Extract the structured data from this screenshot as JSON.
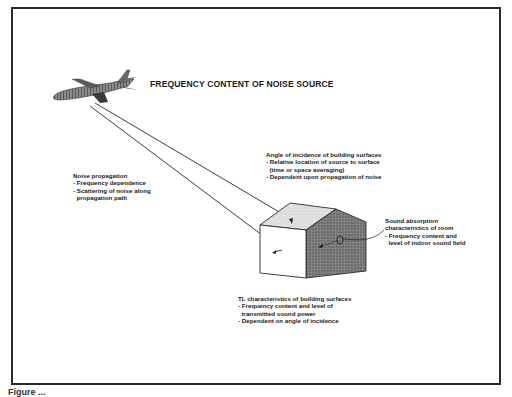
{
  "diagram": {
    "title": "FREQUENCY CONTENT OF NOISE SOURCE",
    "noise_propagation": {
      "heading": "Noise propagation",
      "bullets": [
        "- Frequency dependence",
        "- Scattering of noise along",
        "  propagation path"
      ]
    },
    "angle_of_incidence": {
      "heading": "Angle of incidence of building surfaces",
      "bullets": [
        "- Relative location of source to surface",
        "  (time or space averaging)",
        "- Dependent upon propagation of noise"
      ]
    },
    "sound_absorption": {
      "heading": "Sound absorption",
      "heading2": "characteristics of room",
      "bullets": [
        "- Frequency content and",
        "  level of indoor sound field"
      ]
    },
    "tl_characteristics": {
      "heading": "TL characteristics of building surfaces",
      "bullets": [
        "- Frequency content and level of",
        "  transmitted sound power",
        "- Dependent on angle of incidence"
      ]
    },
    "caption_partial": "Figure ..."
  },
  "colors": {
    "frame": "#2a2a2a",
    "house_dark": "#6e6e6e",
    "house_roof": "#dcdcdc",
    "airplane": "#7a7a7a"
  }
}
